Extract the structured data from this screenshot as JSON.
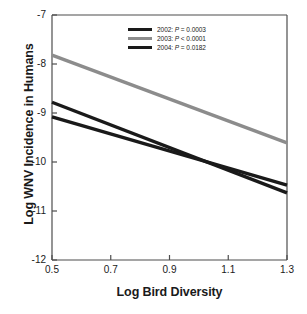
{
  "chart_data": {
    "type": "line",
    "title": "",
    "xlabel": "Log Bird Diversity",
    "ylabel": "Log WNV Incidence in Humans",
    "xlim": [
      0.5,
      1.3
    ],
    "ylim": [
      -12,
      -7
    ],
    "xticks": [
      "0.5",
      "0.7",
      "0.9",
      "1.1",
      "1.3"
    ],
    "xtick_values": [
      0.5,
      0.7,
      0.9,
      1.1,
      1.3
    ],
    "yticks": [
      "-7",
      "-8",
      "-9",
      "-10",
      "-11",
      "-12"
    ],
    "ytick_values": [
      -7,
      -8,
      -9,
      -10,
      -11,
      -12
    ],
    "grid": false,
    "legend_position": "top-center",
    "series": [
      {
        "name": "2002",
        "label": "2002: P = 0.0003",
        "year": "2002",
        "p_text": "P = 0.0003",
        "color": "#1a1a1a",
        "x": [
          0.5,
          1.3
        ],
        "values": [
          -8.78,
          -10.63
        ]
      },
      {
        "name": "2003",
        "label": "2003: P < 0.0001",
        "year": "2003",
        "p_text": "P < 0.0001",
        "color": "#8c8c8c",
        "x": [
          0.5,
          1.3
        ],
        "values": [
          -7.82,
          -9.61
        ]
      },
      {
        "name": "2004",
        "label": "2004: P = 0.0182",
        "year": "2004",
        "p_text": "P = 0.0182",
        "color": "#1a1a1a",
        "x": [
          0.5,
          1.3
        ],
        "values": [
          -9.08,
          -10.47
        ]
      }
    ]
  },
  "axis": {
    "frame_color": "#4d4d4d"
  }
}
